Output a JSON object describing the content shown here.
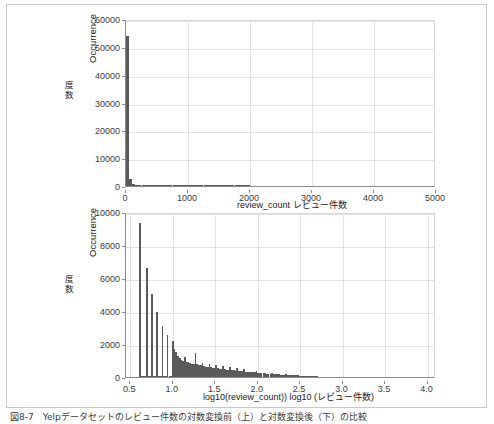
{
  "figure": {
    "caption": "図8-7　Yelpデータセットのレビュー件数の対数変換前（上）と対数変換後（下）の比較"
  },
  "colors": {
    "bar": "#5a5a5a",
    "grid": "#e2e2e2",
    "axis": "#8c8c8c",
    "frame": "#c9c9c9",
    "background": "#ffffff"
  },
  "chart_data": [
    {
      "type": "bar",
      "id": "raw-review-count-histogram",
      "title": "",
      "xlabel": "review_count  レビュー件数",
      "xlabel_en": "review_count",
      "xlabel_jp": "レビュー件数",
      "ylabel_en": "Occurrence",
      "ylabel_jp": "度数",
      "xlim": [
        0,
        5000
      ],
      "ylim": [
        0,
        60000
      ],
      "xticks": [
        "0",
        "1000",
        "2000",
        "3000",
        "4000",
        "5000"
      ],
      "xtick_values": [
        0,
        1000,
        2000,
        3000,
        4000,
        5000
      ],
      "yticks": [
        "0",
        "10000",
        "20000",
        "30000",
        "40000",
        "50000",
        "60000"
      ],
      "ytick_values": [
        0,
        10000,
        20000,
        30000,
        40000,
        50000,
        60000
      ],
      "grid": true,
      "legend": "none",
      "bin_width": 50,
      "x": [
        25,
        75,
        125,
        175,
        225,
        275,
        325,
        375,
        425,
        475,
        525,
        575,
        625,
        675,
        725,
        775,
        825,
        875,
        925,
        975,
        1025,
        1075,
        1125,
        1175,
        1225,
        1275,
        1325,
        1375,
        1425,
        1475,
        1525,
        1575,
        1625,
        1675,
        1725,
        1775,
        1825,
        1875,
        1925,
        1975
      ],
      "values": [
        54000,
        2400,
        900,
        450,
        280,
        180,
        130,
        95,
        70,
        55,
        42,
        33,
        27,
        22,
        18,
        15,
        12,
        10,
        9,
        7,
        6,
        5,
        5,
        4,
        4,
        3,
        3,
        2,
        2,
        2,
        2,
        1,
        1,
        1,
        1,
        1,
        1,
        1,
        1,
        1
      ]
    },
    {
      "type": "bar",
      "id": "log10-review-count-histogram",
      "title": "",
      "xlabel": "log10(review_count))  log10 (レビュー件数)",
      "xlabel_en": "log10(review_count))",
      "xlabel_jp": "log10 (レビュー件数)",
      "ylabel_en": "Occurrence",
      "ylabel_jp": "度数",
      "xlim": [
        0.45,
        4.1
      ],
      "ylim": [
        0,
        10000
      ],
      "xticks": [
        "0.5",
        "1.0",
        "1.5",
        "2.0",
        "2.5",
        "3.0",
        "3.5",
        "4.0"
      ],
      "xtick_values": [
        0.5,
        1.0,
        1.5,
        2.0,
        2.5,
        3.0,
        3.5,
        4.0
      ],
      "yticks": [
        "0",
        "2000",
        "4000",
        "6000",
        "8000",
        "10000"
      ],
      "ytick_values": [
        0,
        2000,
        4000,
        6000,
        8000,
        10000
      ],
      "grid": true,
      "legend": "none",
      "bin_width": 0.0205,
      "x": [
        0.612,
        0.633,
        0.653,
        0.674,
        0.694,
        0.715,
        0.735,
        0.756,
        0.776,
        0.797,
        0.817,
        0.838,
        0.858,
        0.879,
        0.899,
        0.92,
        0.94,
        0.961,
        0.981,
        1.002,
        1.022,
        1.043,
        1.063,
        1.084,
        1.104,
        1.125,
        1.145,
        1.166,
        1.186,
        1.207,
        1.227,
        1.248,
        1.268,
        1.289,
        1.309,
        1.33,
        1.35,
        1.371,
        1.391,
        1.412,
        1.432,
        1.453,
        1.473,
        1.494,
        1.514,
        1.535,
        1.555,
        1.576,
        1.596,
        1.617,
        1.637,
        1.658,
        1.678,
        1.699,
        1.719,
        1.74,
        1.76,
        1.781,
        1.801,
        1.822,
        1.842,
        1.863,
        1.883,
        1.904,
        1.924,
        1.945,
        1.965,
        1.986,
        2.006,
        2.027,
        2.047,
        2.068,
        2.088,
        2.109,
        2.129,
        2.15,
        2.17,
        2.191,
        2.211,
        2.232,
        2.252,
        2.273,
        2.293,
        2.314,
        2.334,
        2.355,
        2.375,
        2.396,
        2.416,
        2.437,
        2.457,
        2.478,
        2.498,
        2.519,
        2.539,
        2.56,
        2.58,
        2.601,
        2.621,
        2.642,
        2.662,
        2.683,
        2.703
      ],
      "values": [
        9350,
        60,
        40,
        30,
        6600,
        35,
        30,
        5050,
        30,
        25,
        3920,
        25,
        20,
        3080,
        20,
        18,
        2560,
        18,
        15,
        2200,
        1700,
        1500,
        1280,
        1150,
        1050,
        980,
        1200,
        900,
        880,
        820,
        800,
        770,
        1430,
        760,
        720,
        700,
        860,
        640,
        620,
        600,
        760,
        580,
        560,
        540,
        700,
        520,
        500,
        480,
        640,
        460,
        440,
        430,
        600,
        420,
        400,
        390,
        560,
        380,
        360,
        350,
        500,
        330,
        310,
        300,
        300,
        290,
        280,
        380,
        260,
        250,
        240,
        230,
        260,
        210,
        200,
        195,
        240,
        180,
        170,
        165,
        200,
        150,
        145,
        140,
        180,
        130,
        120,
        115,
        150,
        105,
        100,
        95,
        90,
        85,
        80,
        70,
        60,
        50,
        42,
        36,
        30,
        22,
        14
      ]
    }
  ]
}
